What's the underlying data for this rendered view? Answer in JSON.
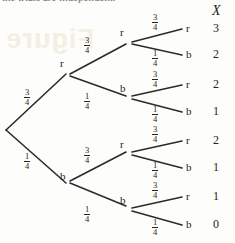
{
  "figure": {
    "kind": "probability-tree-diagram",
    "cropped_caption_fragment": "the trials are independent.",
    "column_header": "X",
    "background_color": "#fdfdfb",
    "ink_color": "#2b2b2b",
    "watermark_text": "Figure",
    "watermark_color": "#f3efe2"
  },
  "labels": {
    "red": "r",
    "black": "b",
    "prob_high": {
      "numerator": "3",
      "denominator": "4"
    },
    "prob_low": {
      "numerator": "1",
      "denominator": "4"
    }
  },
  "tree": {
    "root": {
      "x": 6,
      "y": 130,
      "label": ""
    },
    "level1": [
      {
        "id": "n-r",
        "label": "r",
        "x": 68,
        "y": 72,
        "prob": {
          "numerator": "3",
          "denominator": "4"
        },
        "prob_pos": {
          "x": 24,
          "y": 88
        }
      },
      {
        "id": "n-b",
        "label": "b",
        "x": 68,
        "y": 185,
        "prob": {
          "numerator": "1",
          "denominator": "4"
        },
        "prob_pos": {
          "x": 24,
          "y": 152
        }
      }
    ],
    "level2": [
      {
        "id": "n-rr",
        "label": "r",
        "x": 128,
        "y": 41,
        "parent": "n-r",
        "prob": {
          "numerator": "3",
          "denominator": "4"
        },
        "prob_pos": {
          "x": 84,
          "y": 36
        }
      },
      {
        "id": "n-rb",
        "label": "b",
        "x": 128,
        "y": 97,
        "parent": "n-r",
        "prob": {
          "numerator": "1",
          "denominator": "4"
        },
        "prob_pos": {
          "x": 84,
          "y": 92
        }
      },
      {
        "id": "n-br",
        "label": "r",
        "x": 128,
        "y": 153,
        "parent": "n-b",
        "prob": {
          "numerator": "3",
          "denominator": "4"
        },
        "prob_pos": {
          "x": 84,
          "y": 146
        }
      },
      {
        "id": "n-bb",
        "label": "b",
        "x": 128,
        "y": 209,
        "parent": "n-b",
        "prob": {
          "numerator": "1",
          "denominator": "4"
        },
        "prob_pos": {
          "x": 84,
          "y": 205
        }
      }
    ],
    "leaves": [
      {
        "id": "leaf-1",
        "label": "r",
        "x": 186,
        "y": 29,
        "parent": "n-rr",
        "x_value": "3",
        "prob": {
          "numerator": "3",
          "denominator": "4"
        },
        "prob_pos": {
          "x": 152,
          "y": 13
        }
      },
      {
        "id": "leaf-2",
        "label": "b",
        "x": 186,
        "y": 55,
        "parent": "n-rr",
        "x_value": "2",
        "prob": {
          "numerator": "1",
          "denominator": "4"
        },
        "prob_pos": {
          "x": 152,
          "y": 49
        }
      },
      {
        "id": "leaf-3",
        "label": "r",
        "x": 186,
        "y": 85,
        "parent": "n-rb",
        "x_value": "2",
        "prob": {
          "numerator": "3",
          "denominator": "4"
        },
        "prob_pos": {
          "x": 152,
          "y": 70
        }
      },
      {
        "id": "leaf-4",
        "label": "b",
        "x": 186,
        "y": 112,
        "parent": "n-rb",
        "x_value": "1",
        "prob": {
          "numerator": "1",
          "denominator": "4"
        },
        "prob_pos": {
          "x": 152,
          "y": 105
        }
      },
      {
        "id": "leaf-5",
        "label": "r",
        "x": 186,
        "y": 141,
        "parent": "n-br",
        "x_value": "2",
        "prob": {
          "numerator": "3",
          "denominator": "4"
        },
        "prob_pos": {
          "x": 152,
          "y": 125
        }
      },
      {
        "id": "leaf-6",
        "label": "b",
        "x": 186,
        "y": 168,
        "parent": "n-br",
        "x_value": "1",
        "prob": {
          "numerator": "1",
          "denominator": "4"
        },
        "prob_pos": {
          "x": 152,
          "y": 161
        }
      },
      {
        "id": "leaf-7",
        "label": "r",
        "x": 186,
        "y": 197,
        "parent": "n-bb",
        "x_value": "1",
        "prob": {
          "numerator": "3",
          "denominator": "4"
        },
        "prob_pos": {
          "x": 152,
          "y": 181
        }
      },
      {
        "id": "leaf-8",
        "label": "b",
        "x": 186,
        "y": 225,
        "parent": "n-bb",
        "x_value": "0",
        "prob": {
          "numerator": "1",
          "denominator": "4"
        },
        "prob_pos": {
          "x": 152,
          "y": 218
        }
      }
    ],
    "edges": [
      {
        "from": [
          6,
          130
        ],
        "to": [
          66,
          74
        ],
        "prob": "3/4"
      },
      {
        "from": [
          6,
          130
        ],
        "to": [
          66,
          183
        ],
        "prob": "1/4"
      },
      {
        "from": [
          70,
          74
        ],
        "to": [
          126,
          44
        ],
        "prob": "3/4"
      },
      {
        "from": [
          70,
          76
        ],
        "to": [
          126,
          96
        ],
        "prob": "1/4"
      },
      {
        "from": [
          70,
          181
        ],
        "to": [
          126,
          152
        ],
        "prob": "3/4"
      },
      {
        "from": [
          70,
          183
        ],
        "to": [
          126,
          206
        ],
        "prob": "1/4"
      },
      {
        "from": [
          132,
          42
        ],
        "to": [
          182,
          29
        ],
        "prob": "3/4"
      },
      {
        "from": [
          132,
          44
        ],
        "to": [
          182,
          55
        ],
        "prob": "1/4"
      },
      {
        "from": [
          132,
          96
        ],
        "to": [
          182,
          85
        ],
        "prob": "3/4"
      },
      {
        "from": [
          132,
          99
        ],
        "to": [
          182,
          112
        ],
        "prob": "1/4"
      },
      {
        "from": [
          132,
          152
        ],
        "to": [
          182,
          141
        ],
        "prob": "3/4"
      },
      {
        "from": [
          132,
          155
        ],
        "to": [
          182,
          168
        ],
        "prob": "1/4"
      },
      {
        "from": [
          132,
          208
        ],
        "to": [
          182,
          197
        ],
        "prob": "3/4"
      },
      {
        "from": [
          132,
          211
        ],
        "to": [
          182,
          225
        ],
        "prob": "1/4"
      }
    ]
  },
  "x_column": {
    "header": "X",
    "header_pos": {
      "x": 212,
      "y": 4
    },
    "values": [
      "3",
      "2",
      "2",
      "1",
      "2",
      "1",
      "1",
      "0"
    ]
  }
}
